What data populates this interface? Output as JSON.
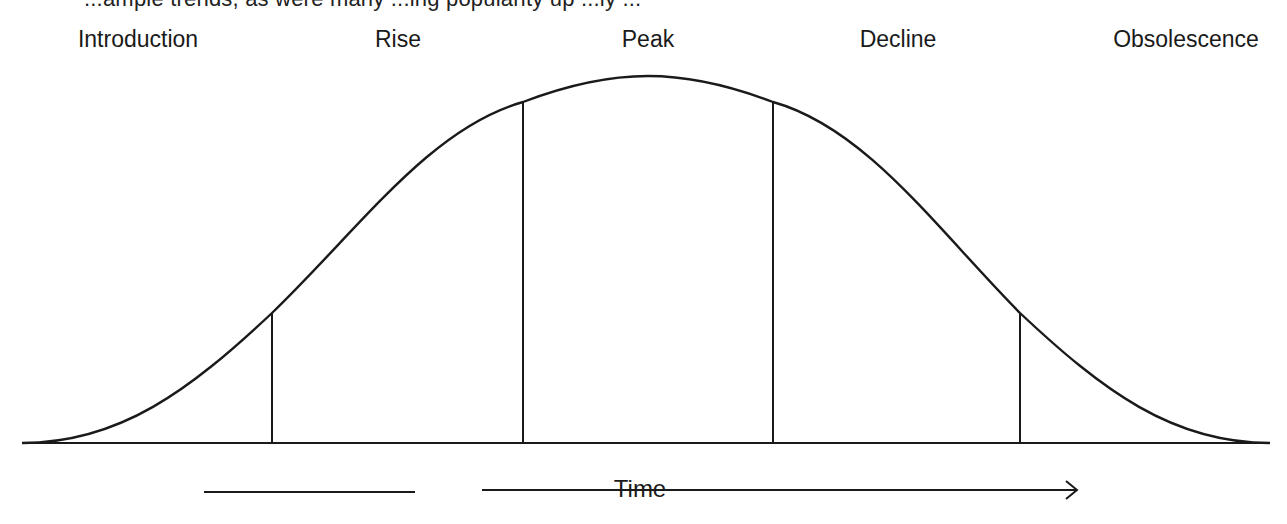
{
  "caption_partial": "...ample trends, as were many ...ing popularity up ...ly ...",
  "stages": [
    {
      "label": "Introduction",
      "center_x": 138
    },
    {
      "label": "Rise",
      "center_x": 398
    },
    {
      "label": "Peak",
      "center_x": 648
    },
    {
      "label": "Decline",
      "center_x": 898
    },
    {
      "label": "Obsolescence",
      "center_x": 1186
    }
  ],
  "axis": {
    "label": "Time",
    "direction": "left-to-right arrow"
  },
  "curve": {
    "type": "bell-curve",
    "peak": {
      "x": 648,
      "y": 76
    },
    "baseline_y": 443,
    "baseline_x_range": [
      22,
      1270
    ]
  },
  "dividers": [
    {
      "x": 272,
      "top_y": 313
    },
    {
      "x": 523,
      "top_y": 102
    },
    {
      "x": 773,
      "top_y": 102
    },
    {
      "x": 1020,
      "top_y": 313
    }
  ],
  "colors": {
    "stroke": "#1a1a1a",
    "background": "#ffffff"
  }
}
